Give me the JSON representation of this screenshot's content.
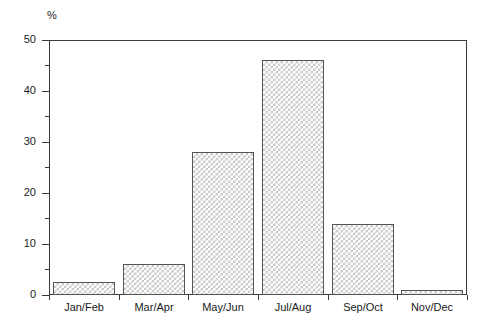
{
  "chart_data": {
    "type": "bar",
    "title": "",
    "subtitle": "",
    "xlabel": "",
    "ylabel": "%",
    "unit_label": "%",
    "categories": [
      "Jan/Feb",
      "Mar/Apr",
      "May/Jun",
      "Jul/Aug",
      "Sep/Oct",
      "Nov/Dec"
    ],
    "values": [
      2.5,
      6,
      28,
      46,
      14,
      1
    ],
    "ylim": [
      0,
      50
    ],
    "ytick_major": [
      0,
      10,
      20,
      30,
      40,
      50
    ],
    "ytick_major_labels": [
      "0",
      "10",
      "20",
      "30",
      "40",
      "50"
    ],
    "ytick_minor": [
      5,
      15,
      25,
      35,
      45
    ],
    "grid": false,
    "legend": null,
    "legend_position": "none",
    "annotations": [],
    "colors": {
      "bar_fill_light": "#ffffff",
      "bar_fill_pattern": "#c9c9c9",
      "bar_border": "#555555",
      "axis": "#3b3b3b",
      "text": "#1a1a1a",
      "background": "#ffffff"
    }
  }
}
